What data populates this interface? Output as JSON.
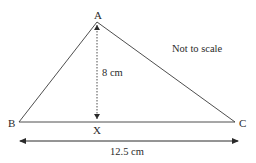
{
  "diagram": {
    "type": "triangle",
    "vertices": {
      "A": {
        "label": "A"
      },
      "B": {
        "label": "B"
      },
      "C": {
        "label": "C"
      },
      "X": {
        "label": "X"
      }
    },
    "height_label": "8 cm",
    "base_label": "12.5 cm",
    "note": "Not to scale",
    "colors": {
      "line": "#3a3a3a",
      "text": "#2a2a2a"
    }
  }
}
